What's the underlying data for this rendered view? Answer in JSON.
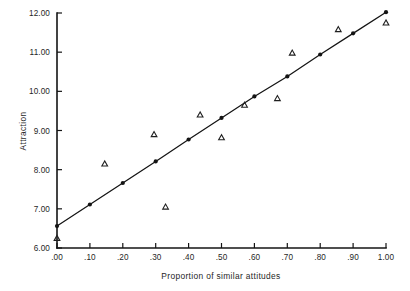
{
  "chart_data": {
    "type": "scatter",
    "title": "",
    "xlabel": "Proportion of similar attitudes",
    "ylabel": "Attraction",
    "xlim": [
      0.0,
      1.0
    ],
    "ylim": [
      6.0,
      12.0
    ],
    "grid": false,
    "legend": "none",
    "xticks": [
      0.0,
      0.1,
      0.2,
      0.3,
      0.4,
      0.5,
      0.6,
      0.7,
      0.8,
      0.9,
      1.0
    ],
    "xticklabels": [
      ".00",
      ".10",
      ".20",
      ".30",
      ".40",
      ".50",
      ".60",
      ".70",
      ".80",
      ".90",
      "1.00"
    ],
    "yticks": [
      6.0,
      7.0,
      8.0,
      9.0,
      10.0,
      11.0,
      12.0
    ],
    "yticklabels": [
      "6.00",
      "7.00",
      "8.00",
      "9.00",
      "10.00",
      "11.00",
      "12.00"
    ],
    "series": [
      {
        "name": "Observed attraction",
        "marker": "open-triangle",
        "points": [
          {
            "x": 0.0,
            "y": 6.25
          },
          {
            "x": 0.145,
            "y": 8.15
          },
          {
            "x": 0.295,
            "y": 8.9
          },
          {
            "x": 0.33,
            "y": 7.05
          },
          {
            "x": 0.435,
            "y": 9.4
          },
          {
            "x": 0.5,
            "y": 8.82
          },
          {
            "x": 0.57,
            "y": 9.65
          },
          {
            "x": 0.67,
            "y": 9.82
          },
          {
            "x": 0.715,
            "y": 10.98
          },
          {
            "x": 0.855,
            "y": 11.58
          },
          {
            "x": 1.0,
            "y": 11.75
          }
        ]
      },
      {
        "name": "Predicted attraction (regression line)",
        "marker": "filled-circle",
        "line": true,
        "points": [
          {
            "x": 0.0,
            "y": 6.56
          },
          {
            "x": 0.1,
            "y": 7.11
          },
          {
            "x": 0.2,
            "y": 7.66
          },
          {
            "x": 0.3,
            "y": 8.21
          },
          {
            "x": 0.4,
            "y": 8.77
          },
          {
            "x": 0.5,
            "y": 9.32
          },
          {
            "x": 0.6,
            "y": 9.87
          },
          {
            "x": 0.7,
            "y": 10.38
          },
          {
            "x": 0.8,
            "y": 10.94
          },
          {
            "x": 0.9,
            "y": 11.48
          },
          {
            "x": 1.0,
            "y": 12.02
          }
        ]
      }
    ]
  },
  "colors": {
    "ink": "#141414",
    "background": "#ffffff"
  }
}
